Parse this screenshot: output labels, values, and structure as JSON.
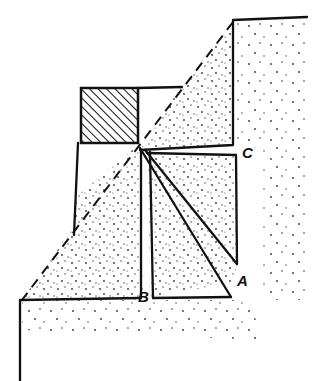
{
  "diagram": {
    "labels": {
      "A": "A",
      "B": "B",
      "C": "C"
    },
    "colors": {
      "ink": "#111111",
      "background": "#ffffff",
      "stipple": "#333333"
    },
    "elements": [
      "stepped-terrain-outline",
      "dashed-slope-line",
      "hatched-block",
      "vertical-plumb-line-to-B",
      "diagonal-line-to-A",
      "line-to-C"
    ]
  }
}
